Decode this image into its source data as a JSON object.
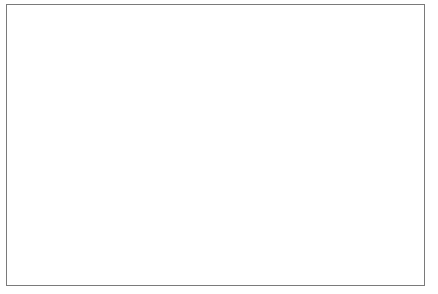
{
  "chart_data": {
    "type": "line",
    "title": "",
    "xlabel": "",
    "ylabel": "MtCO2e",
    "ylabel_display": "MtCO",
    "ylabel_sub": "2",
    "ylabel_tail": "e",
    "ylim": [
      0,
      1000
    ],
    "ytick_step": 100,
    "grid": false,
    "legend_position": "bottom",
    "categories": [
      "1992",
      "1993",
      "1994",
      "1995",
      "1996",
      "1997",
      "1998",
      "1999",
      "2000",
      "2001",
      "2002",
      "2003",
      "2004",
      "2005",
      "2006"
    ],
    "ytick_labels": [
      "0",
      "100",
      "200",
      "300",
      "400",
      "500",
      "600",
      "700",
      "800",
      "900",
      "1,000"
    ],
    "ytick_values": [
      0,
      100,
      200,
      300,
      400,
      500,
      600,
      700,
      800,
      900,
      1000
    ],
    "series": [
      {
        "name": "imports",
        "color": "#555555",
        "values": [
          250,
          258,
          290,
          330,
          365,
          395,
          405,
          420,
          450,
          440,
          490,
          580,
          720,
          830,
          950
        ]
      },
      {
        "name": "exports",
        "color": "#777777",
        "values": [
          140,
          140,
          152,
          165,
          178,
          190,
          188,
          190,
          192,
          188,
          200,
          230,
          265,
          295,
          330
        ]
      }
    ]
  },
  "legend": {
    "items": [
      {
        "label": "imports",
        "color": "#555555"
      },
      {
        "label": "exports",
        "color": "#777777"
      }
    ]
  },
  "colors": {
    "frame_border": "#7a7a7a",
    "axis": "#4a4a4a",
    "background": "#ffffff",
    "text": "#1a1a1a"
  }
}
